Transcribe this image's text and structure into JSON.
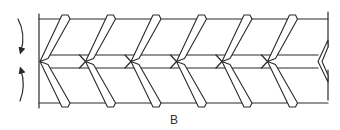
{
  "figure": {
    "label": "B",
    "rotation_arrows": [
      {
        "screw": "upper",
        "direction": "downward"
      },
      {
        "screw": "lower",
        "direction": "upward"
      }
    ],
    "flight_count": 6,
    "colors": {
      "line": "#2a2a2a",
      "background": "#ffffff"
    }
  }
}
